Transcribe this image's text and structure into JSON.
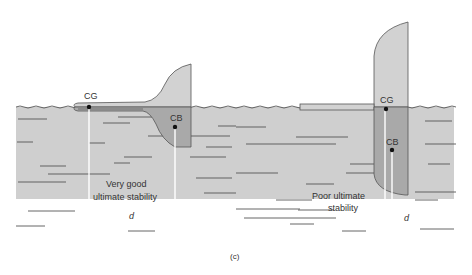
{
  "figure": {
    "caption": "(c)",
    "colors": {
      "water": "#cfcfcf",
      "hull": "#d2d2d2",
      "submerged_hull": "#a9a9a9",
      "outline": "#555555",
      "wave_line": "#444444",
      "arrow": "#ffffff",
      "text": "#333333"
    },
    "left_boat": {
      "cg_label": "CG",
      "cb_label": "CB",
      "stability_label_line1": "Very good",
      "stability_label_line2": "ultimate stability",
      "distance_label": "d"
    },
    "right_boat": {
      "cg_label": "CG",
      "cb_label": "CB",
      "stability_label_line1": "Poor ultimate",
      "stability_label_line2": "stability",
      "distance_label": "d"
    }
  }
}
